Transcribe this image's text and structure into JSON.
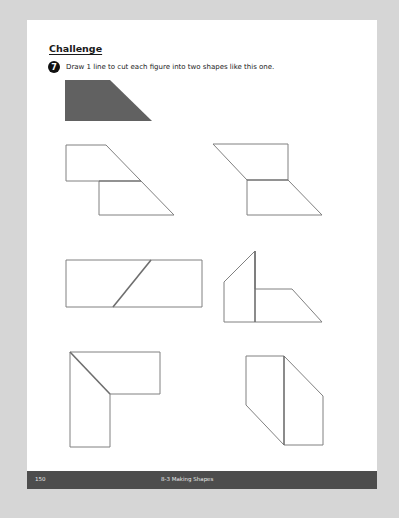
{
  "page": {
    "section_title": "Challenge",
    "question": {
      "number": "7",
      "text": "Draw 1 line to cut each figure into two shapes like this one."
    },
    "sample_shape": {
      "name": "trapezoid",
      "fill": "#616161",
      "points": "65,80 110,80 152,121 65,121"
    },
    "figures": [
      {
        "name": "figure-1",
        "outline": "66,145 106,145 174,215 99,215 99,181 66,181",
        "cut": [
          99,
          181,
          141,
          181
        ]
      },
      {
        "name": "figure-2",
        "outline": "213,144 288,144 288,180 322,215 247,215 247,180",
        "cut": [
          247,
          180,
          288,
          180
        ]
      },
      {
        "name": "figure-3",
        "outline": "66,260 202,260 202,307 66,307",
        "cut": [
          151,
          260,
          113,
          307
        ]
      },
      {
        "name": "figure-4",
        "outline": "224,282 255,251 255,289 292,289 322,322 224,322",
        "cut": [
          255,
          251,
          255,
          322
        ]
      },
      {
        "name": "figure-5",
        "outline": "70,352 160,352 160,394 110,394 110,447 70,447",
        "cut": [
          70,
          352,
          110,
          394
        ]
      },
      {
        "name": "figure-6",
        "outline": "246,356 284,356 323,396 323,445 284,445 246,405",
        "cut": [
          284,
          356,
          284,
          445
        ]
      }
    ],
    "stroke_color": "#808080",
    "cut_color": "#6e6e6e"
  },
  "footer": {
    "page_number": "150",
    "section": "8-3 Making Shapes"
  }
}
